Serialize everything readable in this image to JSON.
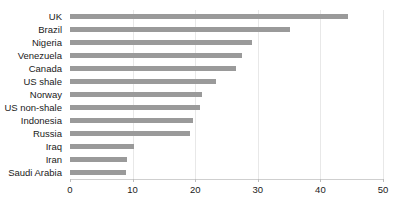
{
  "chart_data": {
    "type": "bar",
    "orientation": "horizontal",
    "title": "",
    "subtitle": "",
    "xlabel": "",
    "ylabel": "",
    "xlim": [
      0,
      50
    ],
    "xticks": [
      0,
      10,
      20,
      30,
      40,
      50
    ],
    "xtick_labels": [
      "0",
      "10",
      "20",
      "30",
      "40",
      "50"
    ],
    "grid": true,
    "legend": false,
    "legend_position": "none",
    "bar_color": "#9a9a9a",
    "gridline_color": "#e8e8e8",
    "label_color": "#1a1a1a",
    "categories": [
      "UK",
      "Brazil",
      "Nigeria",
      "Venezuela",
      "Canada",
      "US shale",
      "Norway",
      "US non-shale",
      "Indonesia",
      "Russia",
      "Iraq",
      "Iran",
      "Saudi Arabia"
    ],
    "values": [
      44.4,
      35.1,
      29.0,
      27.5,
      26.5,
      23.3,
      21.1,
      20.8,
      19.6,
      19.2,
      10.3,
      9.1,
      9.0
    ]
  }
}
